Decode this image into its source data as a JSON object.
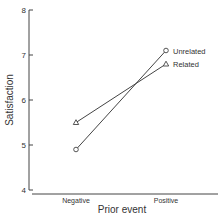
{
  "chart_data": {
    "type": "line",
    "title": "",
    "xlabel": "Prior event",
    "ylabel": "Satisfaction",
    "categories": [
      "Negative",
      "Positive"
    ],
    "ylim": [
      4,
      8
    ],
    "yticks": [
      "4",
      "5",
      "6",
      "7",
      "8"
    ],
    "grid": false,
    "legend_position": "inline-right",
    "series": [
      {
        "name": "Unrelated",
        "marker": "circle",
        "values": [
          4.9,
          7.1
        ]
      },
      {
        "name": "Related",
        "marker": "triangle",
        "values": [
          5.5,
          6.8
        ]
      }
    ]
  },
  "colors": {
    "line": "#444444",
    "text": "#333333",
    "background": "#ffffff"
  }
}
